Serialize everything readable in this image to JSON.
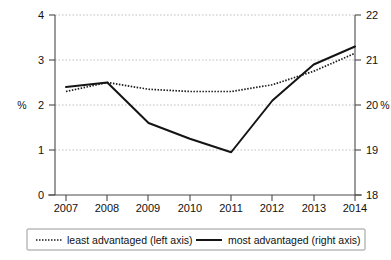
{
  "chart_data": {
    "type": "line",
    "title": "",
    "subtitle": "",
    "xlabel": "",
    "ylabel": "%",
    "y2label": "%",
    "grid": true,
    "legend_position": "bottom",
    "categories": [
      "2007",
      "2008",
      "2009",
      "2010",
      "2011",
      "2012",
      "2013",
      "2014"
    ],
    "x": [
      2007,
      2008,
      2009,
      2010,
      2011,
      2012,
      2013,
      2014
    ],
    "ylim": [
      0,
      4
    ],
    "y2lim": [
      18,
      22
    ],
    "yticks": [
      "0",
      "1",
      "2",
      "3",
      "4"
    ],
    "y2ticks": [
      "18",
      "19",
      "20",
      "21",
      "22"
    ],
    "ytick_values": [
      0,
      1,
      2,
      3,
      4
    ],
    "y2tick_values": [
      18,
      19,
      20,
      21,
      22
    ],
    "series": [
      {
        "name": "least advantaged (left axis)",
        "axis": "left",
        "style": "dotted",
        "values": [
          2.3,
          2.5,
          2.35,
          2.3,
          2.3,
          2.45,
          2.75,
          3.15
        ]
      },
      {
        "name": "most advantaged  (right axis)",
        "axis": "right",
        "style": "solid",
        "values": [
          20.4,
          20.5,
          19.6,
          19.25,
          18.95,
          20.1,
          20.9,
          21.3
        ]
      }
    ]
  },
  "axes": {
    "left_unit_label": "%",
    "right_unit_label": "%",
    "left_unit_at_tick": "2",
    "right_unit_at_tick": "20"
  },
  "legend": {
    "items": [
      {
        "label": "least advantaged (left axis)",
        "marker": "dotted-line-swatch"
      },
      {
        "label": "most advantaged  (right axis)",
        "marker": "solid-line-swatch"
      }
    ]
  }
}
